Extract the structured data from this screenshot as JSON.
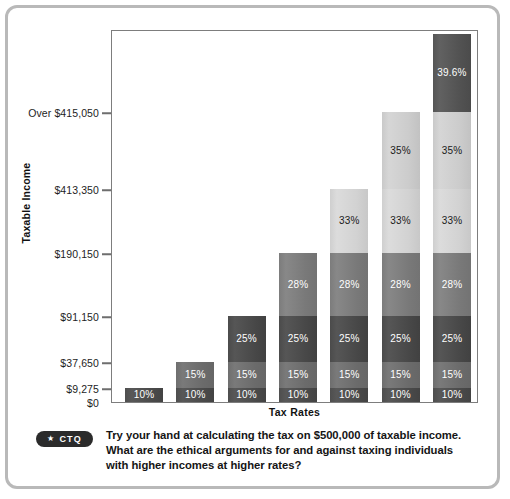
{
  "figure": {
    "y_axis_title": "Taxable Income",
    "x_axis_title": "Tax Rates"
  },
  "caption": {
    "badge_star": "★",
    "badge_label": "CTQ",
    "text": "Try your hand at calculating the tax on $500,000 of taxable income. What are the ethical arguments for and against taxing individuals with higher incomes at higher rates?"
  },
  "chart_data": {
    "type": "bar",
    "title": "",
    "xlabel": "Tax Rates",
    "ylabel": "Taxable Income",
    "stacked": true,
    "grid": false,
    "legend": "none",
    "ytick_labels": [
      "Over $415,050",
      "$413,350",
      "$190,150",
      "$91,150",
      "$37,650",
      "$9,275",
      "$0"
    ],
    "ytick_values": [
      415050,
      413350,
      190150,
      91150,
      37650,
      9275,
      0
    ],
    "categories": [
      "10%",
      "15%",
      "25%",
      "28%",
      "33%",
      "35%",
      "39.6%"
    ],
    "series": [
      {
        "name": "10%",
        "label": "10%",
        "rate": 10,
        "bracket_top": 9275,
        "shade": "#4a4a4a"
      },
      {
        "name": "15%",
        "label": "15%",
        "rate": 15,
        "bracket_top": 37650,
        "shade": "#6e6e6e"
      },
      {
        "name": "25%",
        "label": "25%",
        "rate": 25,
        "bracket_top": 91150,
        "shade": "#484848"
      },
      {
        "name": "28%",
        "label": "28%",
        "rate": 28,
        "bracket_top": 190150,
        "shade": "#7d7d7d"
      },
      {
        "name": "33%",
        "label": "33%",
        "rate": 33,
        "bracket_top": 413350,
        "shade": "#d2d2d2"
      },
      {
        "name": "35%",
        "label": "35%",
        "rate": 35,
        "bracket_top": 415050,
        "shade": "#cccccc"
      },
      {
        "name": "39.6%",
        "label": "39.6%",
        "rate": 39.6,
        "bracket_top": null,
        "shade": "#525252"
      }
    ],
    "bars": [
      {
        "name": "bar-1",
        "segments": [
          "10%"
        ]
      },
      {
        "name": "bar-2",
        "segments": [
          "10%",
          "15%"
        ]
      },
      {
        "name": "bar-3",
        "segments": [
          "10%",
          "15%",
          "25%"
        ]
      },
      {
        "name": "bar-4",
        "segments": [
          "10%",
          "15%",
          "25%",
          "28%"
        ]
      },
      {
        "name": "bar-5",
        "segments": [
          "10%",
          "15%",
          "25%",
          "28%",
          "33%"
        ]
      },
      {
        "name": "bar-6",
        "segments": [
          "10%",
          "15%",
          "25%",
          "28%",
          "33%",
          "35%"
        ]
      },
      {
        "name": "bar-7",
        "segments": [
          "10%",
          "15%",
          "25%",
          "28%",
          "33%",
          "35%",
          "39.6%"
        ]
      }
    ]
  }
}
